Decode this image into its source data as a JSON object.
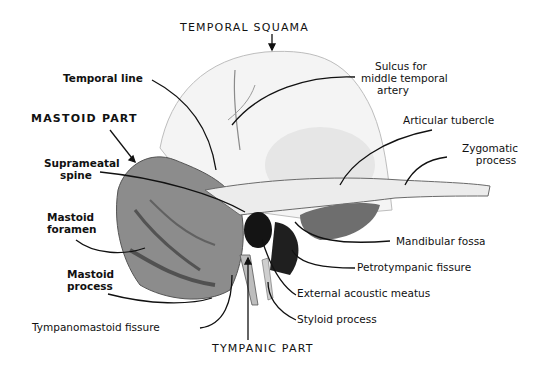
{
  "diagram": {
    "regions": {
      "temporal_squama": "TEMPORAL SQUAMA",
      "mastoid_part": "MASTOID PART",
      "tympanic_part": "TYMPANIC PART"
    },
    "labels": {
      "temporal_line": "Temporal line",
      "sulcus_line1": "Sulcus for",
      "sulcus_line2": "middle temporal",
      "sulcus_line3": "artery",
      "articular_tubercle": "Articular tubercle",
      "zygomatic_line1": "Zygomatic",
      "zygomatic_line2": "process",
      "suprameatal_line1": "Suprameatal",
      "suprameatal_line2": "spine",
      "mastoid_foramen_line1": "Mastoid",
      "mastoid_foramen_line2": "foramen",
      "mastoid_process_line1": "Mastoid",
      "mastoid_process_line2": "process",
      "tympanomastoid_fissure": "Tympanomastoid fissure",
      "mandibular_fossa": "Mandibular fossa",
      "petrotympanic_fissure": "Petrotympanic fissure",
      "external_acoustic_meatus": "External acoustic meatus",
      "styloid_process": "Styloid process"
    },
    "colors": {
      "background": "#ffffff",
      "ink": "#111111",
      "bone_light": "#f2f2f2",
      "bone_shade": "#9a9a9a",
      "bone_dark": "#1a1a1a"
    }
  }
}
